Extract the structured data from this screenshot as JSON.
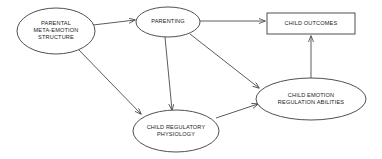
{
  "diagram": {
    "background_color": "#ffffff",
    "line_color": "#4a4a4a",
    "text_color": "#1a1a1a",
    "nodes": [
      {
        "id": "parental-meta-emotion-structure",
        "label": "PARENTAL\nMETA-EMOTION\nSTRUCTURE",
        "shape": "ellipse",
        "cx": 56,
        "cy": 31,
        "rx": 39,
        "ry": 23
      },
      {
        "id": "parenting",
        "label": "PARENTING",
        "shape": "ellipse",
        "cx": 168,
        "cy": 22,
        "rx": 32,
        "ry": 15
      },
      {
        "id": "child-outcomes",
        "label": "CHILD OUTCOMES",
        "shape": "rect",
        "x": 267,
        "y": 13,
        "width": 88,
        "height": 21
      },
      {
        "id": "child-regulatory-physiology",
        "label": "CHILD REGULATORY\nPHYSIOLOGY",
        "shape": "ellipse",
        "cx": 176,
        "cy": 131,
        "rx": 43,
        "ry": 21
      },
      {
        "id": "child-emotion-regulation-abilities",
        "label": "CHILD EMOTION\nREGULATION ABILITIES",
        "shape": "ellipse",
        "cx": 311,
        "cy": 99,
        "rx": 55,
        "ry": 21
      }
    ],
    "edges": [
      {
        "id": "edge-meta-emotion-to-parenting",
        "from": "parental-meta-emotion-structure",
        "to": "parenting",
        "x1": 93,
        "y1": 25,
        "x2": 135,
        "y2": 20
      },
      {
        "id": "edge-parenting-to-child-outcomes",
        "from": "parenting",
        "to": "child-outcomes",
        "x1": 200,
        "y1": 21,
        "x2": 265,
        "y2": 21
      },
      {
        "id": "edge-meta-emotion-to-child-regulatory-physiology",
        "from": "parental-meta-emotion-structure",
        "to": "child-regulatory-physiology",
        "x1": 79,
        "y1": 50,
        "x2": 141,
        "y2": 114
      },
      {
        "id": "edge-parenting-to-child-regulatory-physiology",
        "from": "parenting",
        "to": "child-regulatory-physiology",
        "x1": 165,
        "y1": 37,
        "x2": 172,
        "y2": 110
      },
      {
        "id": "edge-parenting-to-child-emotion-regulation",
        "from": "parenting",
        "to": "child-emotion-regulation-abilities",
        "x1": 190,
        "y1": 34,
        "x2": 259,
        "y2": 88
      },
      {
        "id": "edge-child-regulatory-physiology-to-child-emotion-regulation",
        "from": "child-regulatory-physiology",
        "to": "child-emotion-regulation-abilities",
        "x1": 216,
        "y1": 118,
        "x2": 258,
        "y2": 104
      },
      {
        "id": "edge-child-emotion-regulation-to-child-outcomes",
        "from": "child-emotion-regulation-abilities",
        "to": "child-outcomes",
        "x1": 311,
        "y1": 78,
        "x2": 311,
        "y2": 36
      }
    ]
  }
}
